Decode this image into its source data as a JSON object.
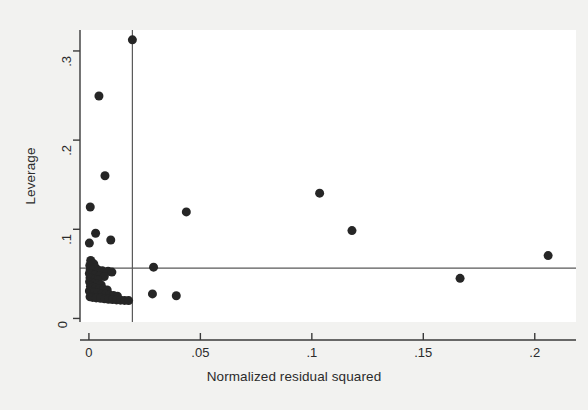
{
  "chart_data": {
    "type": "scatter",
    "title": "",
    "xlabel": "Normalized residual squared",
    "ylabel": "Leverage",
    "xlim": [
      -0.004,
      0.2185
    ],
    "ylim": [
      -0.004,
      0.3235
    ],
    "xticks": [
      0,
      0.05,
      0.1,
      0.15,
      0.2
    ],
    "xticklabels": [
      "0",
      ".05",
      ".1",
      ".15",
      ".2"
    ],
    "yticks": [
      0,
      0.1,
      0.2,
      0.3
    ],
    "yticklabels": [
      "0",
      ".1",
      ".2",
      ".3"
    ],
    "grid": false,
    "legend": null,
    "marker": {
      "shape": "circle",
      "color": "#262626",
      "size_px": 9
    },
    "reference_lines": [
      {
        "name": "mean-normalized-residual-squared",
        "orientation": "vertical",
        "value": 0.0195,
        "color": "#595959"
      },
      {
        "name": "mean-leverage",
        "orientation": "horizontal",
        "value": 0.0565,
        "color": "#595959"
      }
    ],
    "points": [
      {
        "x": 0.0195,
        "y": 0.3125
      },
      {
        "x": 0.0045,
        "y": 0.2495
      },
      {
        "x": 0.0072,
        "y": 0.16
      },
      {
        "x": 0.1035,
        "y": 0.1405
      },
      {
        "x": 0.0437,
        "y": 0.1195
      },
      {
        "x": 0.0006,
        "y": 0.125
      },
      {
        "x": 0.118,
        "y": 0.0985
      },
      {
        "x": 0.003,
        "y": 0.0955
      },
      {
        "x": 0.0098,
        "y": 0.088
      },
      {
        "x": 0.0002,
        "y": 0.0845
      },
      {
        "x": 0.206,
        "y": 0.0705
      },
      {
        "x": 0.029,
        "y": 0.0575
      },
      {
        "x": 0.1665,
        "y": 0.045
      },
      {
        "x": 0.0285,
        "y": 0.0275
      },
      {
        "x": 0.0392,
        "y": 0.0255
      },
      {
        "x": 0.0008,
        "y": 0.065
      },
      {
        "x": 0.0014,
        "y": 0.0625
      },
      {
        "x": 0.0022,
        "y": 0.061
      },
      {
        "x": 0.0004,
        "y": 0.0595
      },
      {
        "x": 0.0011,
        "y": 0.058
      },
      {
        "x": 0.0019,
        "y": 0.0572
      },
      {
        "x": 0.0031,
        "y": 0.0565
      },
      {
        "x": 0.0006,
        "y": 0.0552
      },
      {
        "x": 0.0016,
        "y": 0.0545
      },
      {
        "x": 0.0042,
        "y": 0.054
      },
      {
        "x": 0.006,
        "y": 0.0535
      },
      {
        "x": 0.0086,
        "y": 0.0528
      },
      {
        "x": 0.0103,
        "y": 0.052
      },
      {
        "x": 0.0002,
        "y": 0.0505
      },
      {
        "x": 0.001,
        "y": 0.0495
      },
      {
        "x": 0.0025,
        "y": 0.0488
      },
      {
        "x": 0.005,
        "y": 0.048
      },
      {
        "x": 0.0069,
        "y": 0.047
      },
      {
        "x": 0.0005,
        "y": 0.0455
      },
      {
        "x": 0.0014,
        "y": 0.0445
      },
      {
        "x": 0.0029,
        "y": 0.0438
      },
      {
        "x": 0.0041,
        "y": 0.0428
      },
      {
        "x": 0.0003,
        "y": 0.0412
      },
      {
        "x": 0.0012,
        "y": 0.04
      },
      {
        "x": 0.0023,
        "y": 0.0392
      },
      {
        "x": 0.0036,
        "y": 0.0382
      },
      {
        "x": 0.0055,
        "y": 0.0375
      },
      {
        "x": 0.0007,
        "y": 0.036
      },
      {
        "x": 0.0018,
        "y": 0.035
      },
      {
        "x": 0.003,
        "y": 0.0342
      },
      {
        "x": 0.0048,
        "y": 0.0335
      },
      {
        "x": 0.0065,
        "y": 0.0328
      },
      {
        "x": 0.0082,
        "y": 0.032
      },
      {
        "x": 0.0002,
        "y": 0.0308
      },
      {
        "x": 0.0013,
        "y": 0.03
      },
      {
        "x": 0.0026,
        "y": 0.0292
      },
      {
        "x": 0.004,
        "y": 0.0285
      },
      {
        "x": 0.0058,
        "y": 0.0278
      },
      {
        "x": 0.0075,
        "y": 0.0272
      },
      {
        "x": 0.0092,
        "y": 0.0265
      },
      {
        "x": 0.011,
        "y": 0.0258
      },
      {
        "x": 0.0128,
        "y": 0.025
      },
      {
        "x": 0.0005,
        "y": 0.0242
      },
      {
        "x": 0.0017,
        "y": 0.0236
      },
      {
        "x": 0.0033,
        "y": 0.023
      },
      {
        "x": 0.0052,
        "y": 0.0225
      },
      {
        "x": 0.007,
        "y": 0.022
      },
      {
        "x": 0.0088,
        "y": 0.0215
      },
      {
        "x": 0.0106,
        "y": 0.0212
      },
      {
        "x": 0.0124,
        "y": 0.0208
      },
      {
        "x": 0.0142,
        "y": 0.0205
      },
      {
        "x": 0.016,
        "y": 0.0202
      },
      {
        "x": 0.0178,
        "y": 0.02
      }
    ]
  },
  "figure": {
    "background_color": "#f2f2f0",
    "plot_background_color": "#ffffff",
    "axis_color": "#3a3a3a"
  }
}
